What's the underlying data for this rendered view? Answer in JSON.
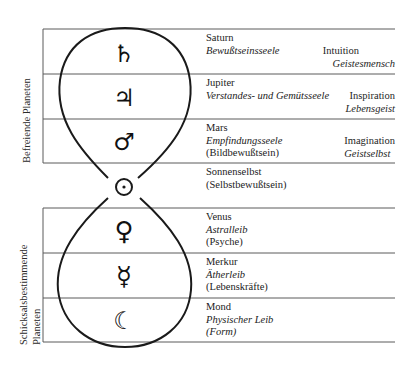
{
  "diagram": {
    "groups": {
      "upper": {
        "label": "Befreiende Planeten"
      },
      "lower": {
        "label_line1": "Schicksalsbestimmende",
        "label_line2": "Planeten"
      }
    },
    "rows": [
      {
        "symbol": "♄",
        "symbol_name": "saturn",
        "name": "Saturn",
        "soul": "Bewußtseinsseele",
        "paren": "",
        "side_upright": "Intuition",
        "side_italic": "Geistesmensch"
      },
      {
        "symbol": "♃",
        "symbol_name": "jupiter",
        "name": "Jupiter",
        "soul": "Verstandes- und Gemütsseele",
        "paren": "",
        "side_upright": "Inspiration",
        "side_italic": "Lebensgeist"
      },
      {
        "symbol": "♂",
        "symbol_name": "mars",
        "name": "Mars",
        "soul": "Empfindungsseele",
        "paren": "(Bildbewußtsein)",
        "side_upright": "Imagination",
        "side_italic": "Geistselbst"
      },
      {
        "symbol": "☉",
        "symbol_name": "sun",
        "name": "Sonnenselbst",
        "soul": "",
        "paren": "(Selbstbewußtsein)",
        "side_upright": "",
        "side_italic": ""
      },
      {
        "symbol": "♀",
        "symbol_name": "venus",
        "name": "Venus",
        "soul": "Astralleib",
        "paren": "(Psyche)",
        "side_upright": "",
        "side_italic": ""
      },
      {
        "symbol": "☿",
        "symbol_name": "mercury",
        "name": "Merkur",
        "soul": "Ätherleib",
        "paren": "(Lebenskräfte)",
        "side_upright": "",
        "side_italic": ""
      },
      {
        "symbol": "☾",
        "symbol_name": "moon",
        "name": "Mond",
        "soul": "Physischer Leib",
        "paren": "(Form)",
        "side_upright": "",
        "side_italic": ""
      }
    ],
    "colors": {
      "ink": "#1e1e1e",
      "rule": "#555555"
    }
  }
}
